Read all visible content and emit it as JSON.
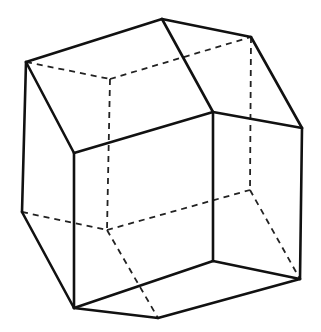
{
  "figure": {
    "type": "polyhedron-line-drawing",
    "colors": {
      "background": "#ffffff",
      "line": "#111111"
    },
    "vertices": {
      "A": [
        26,
        62
      ],
      "T": [
        162,
        19
      ],
      "R1": [
        251,
        37
      ],
      "B": [
        74,
        153
      ],
      "C": [
        213,
        112
      ],
      "R2": [
        302,
        128
      ],
      "L": [
        22,
        212
      ],
      "D": [
        74,
        308
      ],
      "E": [
        213,
        261
      ],
      "R3": [
        300,
        279
      ],
      "Bot": [
        158,
        318
      ],
      "H1": [
        110,
        79
      ],
      "H2": [
        107,
        230
      ],
      "H3": [
        250,
        190
      ]
    },
    "solid_edges": [
      [
        "A",
        "T"
      ],
      [
        "T",
        "R1"
      ],
      [
        "R1",
        "R2"
      ],
      [
        "T",
        "C"
      ],
      [
        "C",
        "R2"
      ],
      [
        "A",
        "B"
      ],
      [
        "B",
        "C"
      ],
      [
        "A",
        "L"
      ],
      [
        "L",
        "D"
      ],
      [
        "B",
        "D"
      ],
      [
        "C",
        "E"
      ],
      [
        "R2",
        "R3"
      ],
      [
        "E",
        "R3"
      ],
      [
        "D",
        "E"
      ],
      [
        "D",
        "Bot"
      ],
      [
        "Bot",
        "R3"
      ]
    ],
    "dashed_edges": [
      [
        "A",
        "H1"
      ],
      [
        "H1",
        "R1"
      ],
      [
        "H1",
        "H2"
      ],
      [
        "L",
        "H2"
      ],
      [
        "H2",
        "H3"
      ],
      [
        "R1",
        "H3"
      ],
      [
        "H3",
        "R3"
      ],
      [
        "H2",
        "Bot"
      ]
    ]
  }
}
